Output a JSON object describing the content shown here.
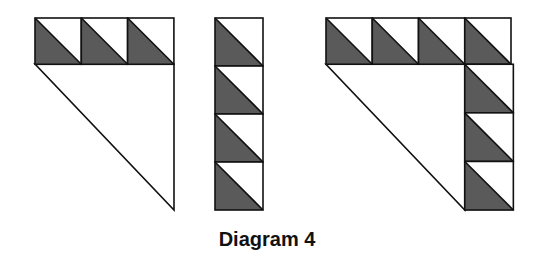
{
  "caption": "Diagram 4",
  "colors": {
    "fill_dark": "#5a5a5a",
    "fill_light": "#ffffff",
    "stroke": "#111111",
    "background": "#ffffff"
  },
  "figures": [
    {
      "name": "figure-row-of-three",
      "description": "Row of 3 half-square triangles over a large right triangle",
      "squares": [
        {
          "x": 35,
          "y": 18,
          "size": 46.3
        },
        {
          "x": 81.3,
          "y": 18,
          "size": 46.3
        },
        {
          "x": 127.6,
          "y": 18,
          "size": 46.3
        }
      ],
      "large_triangle": [
        [
          35,
          64
        ],
        [
          174,
          64
        ],
        [
          174,
          210
        ]
      ]
    },
    {
      "name": "figure-column-of-four",
      "description": "Column of 4 half-square triangles",
      "squares": [
        {
          "x": 215,
          "y": 18,
          "size": 48
        },
        {
          "x": 215,
          "y": 66,
          "size": 48
        },
        {
          "x": 215,
          "y": 114,
          "size": 48
        },
        {
          "x": 215,
          "y": 162,
          "size": 48
        }
      ]
    },
    {
      "name": "figure-combined-l-shape",
      "description": "Row of 4 plus column of 3 half-square triangles around a large right triangle",
      "squares": [
        {
          "x": 326,
          "y": 18,
          "size": 46.25
        },
        {
          "x": 372.25,
          "y": 18,
          "size": 46.25
        },
        {
          "x": 418.5,
          "y": 18,
          "size": 46.25
        },
        {
          "x": 464.75,
          "y": 18,
          "size": 46.25
        },
        {
          "x": 464.75,
          "y": 64.25,
          "size": 48.6
        },
        {
          "x": 464.75,
          "y": 112.85,
          "size": 48.6
        },
        {
          "x": 464.75,
          "y": 161.45,
          "size": 48.6
        }
      ],
      "large_triangle": [
        [
          326,
          64.25
        ],
        [
          464.75,
          64.25
        ],
        [
          464.75,
          210
        ]
      ]
    }
  ]
}
